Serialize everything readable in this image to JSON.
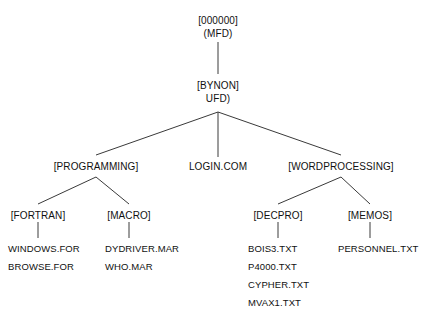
{
  "diagram": {
    "title_text": "VAX directory tree structure",
    "line_color": "#3a3a3a",
    "text_color": "#111111",
    "background": "#ffffff",
    "root": {
      "line1": "[000000]",
      "line2": "(MFD)"
    },
    "level2": {
      "line1": "[BYNON]",
      "line2": "UFD)"
    },
    "level3": {
      "programming": "[PROGRAMMING]",
      "login": "LOGIN.COM",
      "wordprocessing": "[WORDPROCESSING]"
    },
    "level4": {
      "fortran": "[FORTRAN]",
      "macro": "[MACRO]",
      "decpro": "[DECPRO]",
      "memos": "[MEMOS]"
    },
    "files": {
      "fortran": [
        "WINDOWS.FOR",
        "BROWSE.FOR"
      ],
      "macro": [
        "DYDRIVER.MAR",
        "WHO.MAR"
      ],
      "decpro": [
        "BOIS3.TXT",
        "P4000.TXT",
        "CYPHER.TXT",
        "MVAX1.TXT"
      ],
      "memos": [
        "PERSONNEL.TXT"
      ]
    }
  }
}
